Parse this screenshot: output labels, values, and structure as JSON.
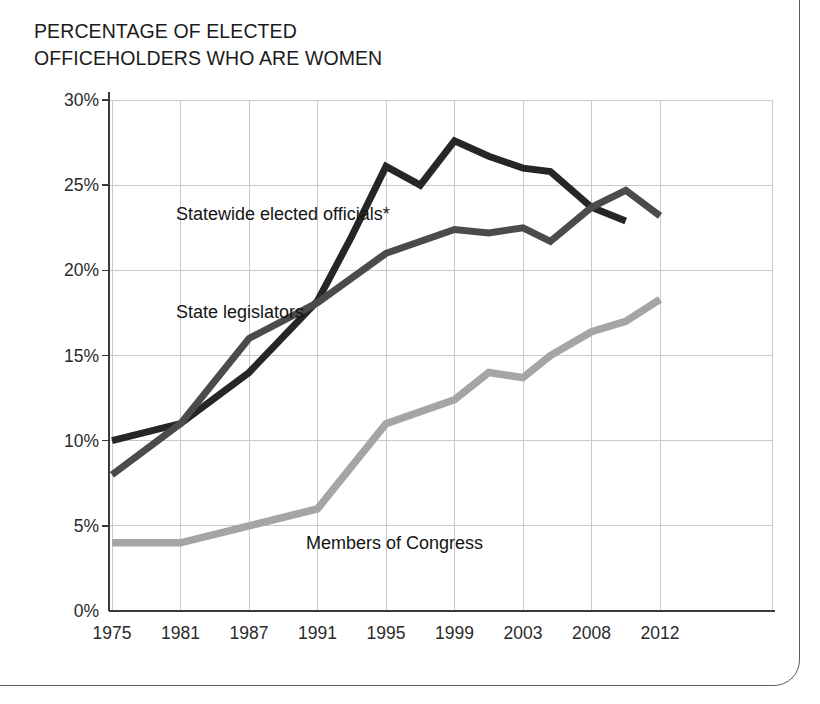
{
  "title": "PERCENTAGE OF ELECTED\nOFFICEHOLDERS WHO ARE WOMEN",
  "axis": {
    "y_ticks": [
      "0%",
      "5%",
      "10%",
      "15%",
      "20%",
      "25%",
      "30%"
    ],
    "x_ticks": [
      "1975",
      "1981",
      "1987",
      "1991",
      "1995",
      "1999",
      "2003",
      "2008",
      "2012"
    ]
  },
  "labels": {
    "statewide": "Statewide elected officials*",
    "legislators": "State legislators",
    "congress": "Members of Congress"
  },
  "colors": {
    "statewide": "#262626",
    "legislators": "#4b4b4b",
    "congress": "#a5a5a5",
    "grid": "#c9c9c9",
    "axis": "#3a3a3a",
    "card_border": "#5c5c5c",
    "text": "#1b1b1b"
  },
  "chart_data": {
    "type": "line",
    "title": "PERCENTAGE OF ELECTED OFFICEHOLDERS WHO ARE WOMEN",
    "xlabel": "",
    "ylabel": "",
    "ylim": [
      0,
      30
    ],
    "xlim": [
      1975,
      2012
    ],
    "grid": true,
    "legend_position": "inline-annotations",
    "ytick_labels": [
      "0%",
      "5%",
      "10%",
      "15%",
      "20%",
      "25%",
      "30%"
    ],
    "ytick_values": [
      0,
      5,
      10,
      15,
      20,
      25,
      30
    ],
    "xtick_labels": [
      "1975",
      "1981",
      "1987",
      "1991",
      "1995",
      "1999",
      "2003",
      "2008",
      "2012"
    ],
    "xtick_values": [
      1975,
      1981,
      1987,
      1991,
      1995,
      1999,
      2003,
      2008,
      2012
    ],
    "series": [
      {
        "name": "Statewide elected officials*",
        "color": "#262626",
        "x": [
          1975,
          1981,
          1987,
          1991,
          1993,
          1995,
          1997,
          1999,
          2001,
          2003,
          2005,
          2008,
          2010
        ],
        "values": [
          10.0,
          11.0,
          14.0,
          18.2,
          22.0,
          26.1,
          25.0,
          27.6,
          26.7,
          26.0,
          25.8,
          23.7,
          22.9
        ]
      },
      {
        "name": "State legislators",
        "color": "#4b4b4b",
        "x": [
          1975,
          1981,
          1987,
          1991,
          1995,
          1999,
          2001,
          2003,
          2005,
          2008,
          2010,
          2012
        ],
        "values": [
          8.0,
          11.0,
          16.0,
          18.1,
          21.0,
          22.4,
          22.2,
          22.5,
          21.7,
          23.7,
          24.7,
          23.2
        ]
      },
      {
        "name": "Members of Congress",
        "color": "#a5a5a5",
        "x": [
          1975,
          1981,
          1987,
          1991,
          1995,
          1999,
          2001,
          2003,
          2005,
          2008,
          2010,
          2012
        ],
        "values": [
          4.0,
          4.0,
          5.0,
          6.0,
          11.0,
          12.4,
          14.0,
          13.7,
          15.0,
          16.4,
          17.0,
          18.3
        ]
      }
    ]
  }
}
